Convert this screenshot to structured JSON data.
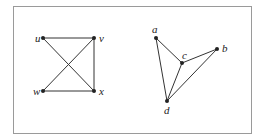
{
  "figure": {
    "frame": {
      "x": 13,
      "y": 6,
      "width": 238,
      "height": 127,
      "stroke": "#9a9a9a"
    },
    "colors": {
      "edge": "#333333",
      "node": "#222222",
      "label": "#222222"
    },
    "graphs": [
      {
        "name": "left-graph",
        "nodes": [
          {
            "id": "u",
            "label": "u",
            "x": 43,
            "y": 38,
            "lx": 35,
            "ly": 42
          },
          {
            "id": "v",
            "label": "v",
            "x": 94,
            "y": 38,
            "lx": 99,
            "ly": 42
          },
          {
            "id": "w",
            "label": "w",
            "x": 43,
            "y": 91,
            "lx": 33,
            "ly": 95
          },
          {
            "id": "x",
            "label": "x",
            "x": 94,
            "y": 91,
            "lx": 99,
            "ly": 95
          }
        ],
        "edges": [
          [
            "u",
            "v"
          ],
          [
            "u",
            "x"
          ],
          [
            "v",
            "w"
          ],
          [
            "v",
            "x"
          ],
          [
            "w",
            "x"
          ]
        ]
      },
      {
        "name": "right-graph",
        "nodes": [
          {
            "id": "a",
            "label": "a",
            "x": 156,
            "y": 38,
            "lx": 152,
            "ly": 33
          },
          {
            "id": "b",
            "label": "b",
            "x": 217,
            "y": 49,
            "lx": 222,
            "ly": 52
          },
          {
            "id": "c",
            "label": "c",
            "x": 182,
            "y": 63,
            "lx": 182,
            "ly": 59
          },
          {
            "id": "d",
            "label": "d",
            "x": 167,
            "y": 101,
            "lx": 164,
            "ly": 114
          }
        ],
        "edges": [
          [
            "a",
            "c"
          ],
          [
            "a",
            "d"
          ],
          [
            "c",
            "b"
          ],
          [
            "c",
            "d"
          ],
          [
            "b",
            "d"
          ]
        ]
      }
    ]
  }
}
